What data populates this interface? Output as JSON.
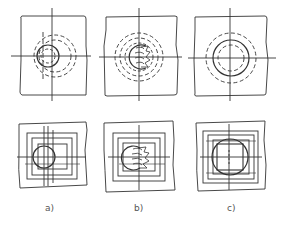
{
  "figure": {
    "caption_cut": "·········································",
    "labels": [
      "a)",
      "b)",
      "c)"
    ],
    "colors": {
      "line": "#333333",
      "background": "#ffffff",
      "label": "#555555"
    },
    "panels": [
      {
        "id": "a-top",
        "column": "a",
        "row": "top",
        "shape": "dashed concentric circles with offset solid circle"
      },
      {
        "id": "b-top",
        "column": "b",
        "row": "top",
        "shape": "dashed concentric circles with partial circle and hatch marks"
      },
      {
        "id": "c-top",
        "column": "c",
        "row": "top",
        "shape": "concentric circles centered, solid inner ring"
      },
      {
        "id": "a-bottom",
        "column": "a",
        "row": "bottom",
        "shape": "nested squares with offset circle"
      },
      {
        "id": "b-bottom",
        "column": "b",
        "row": "bottom",
        "shape": "nested squares with partial circle and hatch marks"
      },
      {
        "id": "c-bottom",
        "column": "c",
        "row": "bottom",
        "shape": "nested squares with centered circle and inscribed square"
      }
    ]
  }
}
